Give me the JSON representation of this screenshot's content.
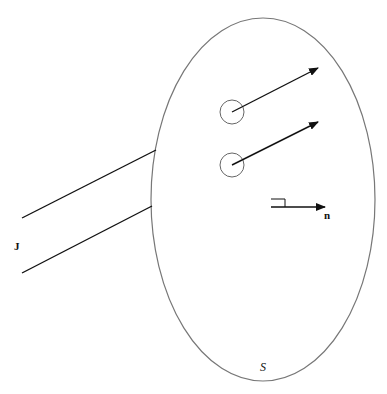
{
  "diagram": {
    "labels": {
      "current": "J",
      "normal": "n",
      "surface": "S"
    },
    "colors": {
      "stroke": "#111111",
      "surface_stroke": "#777777",
      "circle_stroke": "#666666",
      "background": "#ffffff"
    },
    "surface": {
      "cx": 263,
      "cy": 199.5,
      "rx": 112,
      "ry": 181.5
    },
    "current_tube_lines": [
      {
        "x1": 22,
        "y1": 218,
        "x2": 156,
        "y2": 150
      },
      {
        "x1": 22,
        "y1": 273,
        "x2": 152,
        "y2": 206
      }
    ],
    "loops": [
      {
        "cx": 232,
        "cy": 112,
        "r": 12,
        "arrow_to": [
          318,
          68
        ]
      },
      {
        "cx": 232,
        "cy": 165,
        "r": 12,
        "arrow_to": [
          318,
          122
        ]
      }
    ],
    "normal_vector": {
      "x1": 271,
      "y1": 207,
      "x2": 325,
      "y2": 207
    }
  }
}
